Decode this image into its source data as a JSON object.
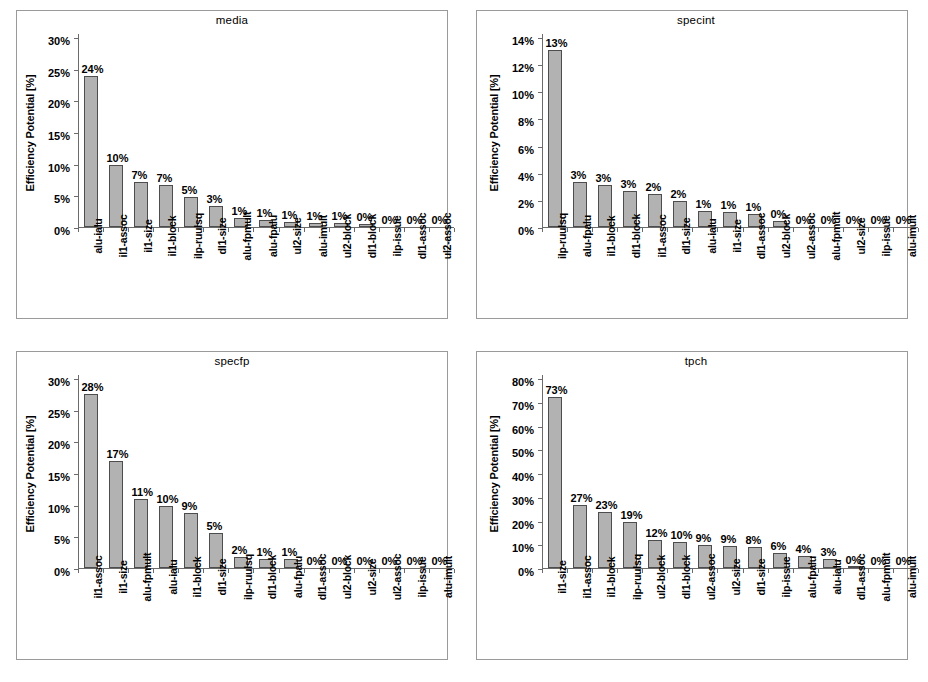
{
  "page": {
    "background": "#ffffff",
    "bar_fill": "#b2b2b2",
    "bar_border": "#4d4d4d",
    "axis_color": "#6b6b6b",
    "frame_color": "#9a9a9a"
  },
  "chart_data": [
    {
      "type": "bar",
      "title": "media",
      "xlabel": "",
      "ylabel": "Efficiency Potential [%]",
      "ylim": [
        0,
        30
      ],
      "ytick_step": 5,
      "yticks": [
        "0%",
        "5%",
        "10%",
        "15%",
        "20%",
        "25%",
        "30%"
      ],
      "grid": false,
      "legend": "none",
      "categories": [
        "alu-ialu",
        "il1-assoc",
        "il1-size",
        "il1-block",
        "ilp-ruulsq",
        "dl1-size",
        "alu-fpmult",
        "alu-fpalu",
        "ul2-size",
        "alu-imult",
        "ul2-block",
        "dl1-block",
        "ilp-issue",
        "dl1-assoc",
        "ul2-assoc"
      ],
      "values": [
        24.0,
        9.9,
        7.2,
        6.6,
        4.8,
        3.3,
        1.4,
        1.1,
        0.8,
        0.7,
        0.7,
        0.4,
        0.0,
        0.0,
        0.0
      ],
      "data_labels": [
        "24%",
        "10%",
        "7%",
        "7%",
        "5%",
        "3%",
        "1%",
        "1%",
        "1%",
        "1%",
        "1%",
        "0%",
        "0%",
        "0%",
        "0%"
      ]
    },
    {
      "type": "bar",
      "title": "specint",
      "xlabel": "",
      "ylabel": "Efficiency Potential [%]",
      "ylim": [
        0,
        14
      ],
      "ytick_step": 2,
      "yticks": [
        "0%",
        "2%",
        "4%",
        "6%",
        "8%",
        "10%",
        "12%",
        "14%"
      ],
      "grid": false,
      "legend": "none",
      "categories": [
        "ilp-ruulsq",
        "alu-fpalu",
        "il1-block",
        "dl1-block",
        "il1-assoc",
        "dl1-size",
        "alu-ialu",
        "il1-size",
        "dl1-assoc",
        "ul2-block",
        "ul2-assoc",
        "alu-fpmult",
        "ul2-size",
        "ilp-issue",
        "alu-imult"
      ],
      "values": [
        13.1,
        3.3,
        3.1,
        2.65,
        2.45,
        1.95,
        1.15,
        1.1,
        1.0,
        0.45,
        0.0,
        0.0,
        0.0,
        0.0,
        0.0
      ],
      "data_labels": [
        "13%",
        "3%",
        "3%",
        "3%",
        "2%",
        "2%",
        "1%",
        "1%",
        "1%",
        "0%",
        "0%",
        "0%",
        "0%",
        "0%",
        "0%"
      ]
    },
    {
      "type": "bar",
      "title": "specfp",
      "xlabel": "",
      "ylabel": "Efficiency Potential [%]",
      "ylim": [
        0,
        30
      ],
      "ytick_step": 5,
      "yticks": [
        "0%",
        "5%",
        "10%",
        "15%",
        "20%",
        "25%",
        "30%"
      ],
      "grid": false,
      "legend": "none",
      "categories": [
        "il1-assoc",
        "il1-size",
        "alu-fpmult",
        "alu-ialu",
        "il1-block",
        "dl1-size",
        "ilp-ruulsq",
        "dl1-block",
        "alu-fpalu",
        "dl1-assoc",
        "ul2-block",
        "ul2-size",
        "ul2-assoc",
        "ilp-issue",
        "alu-imult"
      ],
      "values": [
        27.6,
        17.0,
        10.9,
        9.9,
        8.8,
        5.5,
        1.8,
        1.5,
        1.4,
        0.0,
        0.0,
        0.0,
        0.0,
        0.0,
        0.0
      ],
      "data_labels": [
        "28%",
        "17%",
        "11%",
        "10%",
        "9%",
        "5%",
        "2%",
        "1%",
        "1%",
        "0%",
        "0%",
        "0%",
        "0%",
        "0%",
        "0%"
      ]
    },
    {
      "type": "bar",
      "title": "tpch",
      "xlabel": "",
      "ylabel": "Efficiency Potential [%]",
      "ylim": [
        0,
        80
      ],
      "ytick_step": 10,
      "yticks": [
        "0%",
        "10%",
        "20%",
        "30%",
        "40%",
        "50%",
        "60%",
        "70%",
        "80%"
      ],
      "grid": false,
      "legend": "none",
      "categories": [
        "il1-size",
        "il1-assoc",
        "il1-block",
        "ilp-ruulsq",
        "ul2-block",
        "dl1-block",
        "ul2-assoc",
        "ul2-size",
        "dl1-size",
        "ilp-issue",
        "alu-fpalu",
        "alu-ialu",
        "dl1-assoc",
        "alu-fpmult",
        "alu-imult"
      ],
      "values": [
        72.5,
        26.8,
        23.6,
        19.6,
        11.8,
        10.9,
        9.6,
        9.5,
        9.0,
        6.5,
        4.9,
        3.7,
        0.6,
        0.0,
        0.0
      ],
      "data_labels": [
        "73%",
        "27%",
        "23%",
        "19%",
        "12%",
        "10%",
        "9%",
        "9%",
        "8%",
        "6%",
        "4%",
        "3%",
        "0%",
        "0%",
        "0%"
      ]
    }
  ]
}
